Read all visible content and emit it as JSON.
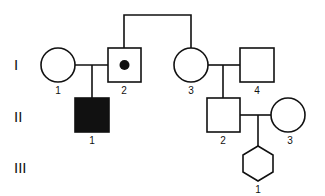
{
  "diagram": {
    "type": "pedigree",
    "generations": [
      {
        "label": "I"
      },
      {
        "label": "II"
      },
      {
        "label": "III"
      }
    ],
    "individuals": [
      {
        "id": "I-1",
        "number": "1",
        "sex": "female",
        "shape": "circle",
        "status": "unaffected"
      },
      {
        "id": "I-2",
        "number": "2",
        "sex": "male",
        "shape": "square",
        "status": "carrier"
      },
      {
        "id": "I-3",
        "number": "3",
        "sex": "female",
        "shape": "circle",
        "status": "unaffected"
      },
      {
        "id": "I-4",
        "number": "4",
        "sex": "male",
        "shape": "square",
        "status": "unaffected"
      },
      {
        "id": "II-1",
        "number": "1",
        "sex": "male",
        "shape": "square",
        "status": "affected"
      },
      {
        "id": "II-2",
        "number": "2",
        "sex": "male",
        "shape": "square",
        "status": "unaffected"
      },
      {
        "id": "II-3",
        "number": "3",
        "sex": "female",
        "shape": "circle",
        "status": "unaffected"
      },
      {
        "id": "III-1",
        "number": "1",
        "sex": "unknown",
        "shape": "hexagon",
        "status": "unaffected"
      }
    ],
    "relationships": [
      {
        "type": "siblings",
        "members": [
          "I-2",
          "I-3"
        ]
      },
      {
        "type": "mating",
        "partners": [
          "I-1",
          "I-2"
        ],
        "children": [
          "II-1"
        ]
      },
      {
        "type": "mating",
        "partners": [
          "I-3",
          "I-4"
        ],
        "children": [
          "II-2"
        ]
      },
      {
        "type": "mating",
        "partners": [
          "II-2",
          "II-3"
        ],
        "children": [
          "III-1"
        ]
      }
    ],
    "colors": {
      "stroke": "#111111",
      "fill_affected": "#111111",
      "background": "#ffffff"
    }
  }
}
